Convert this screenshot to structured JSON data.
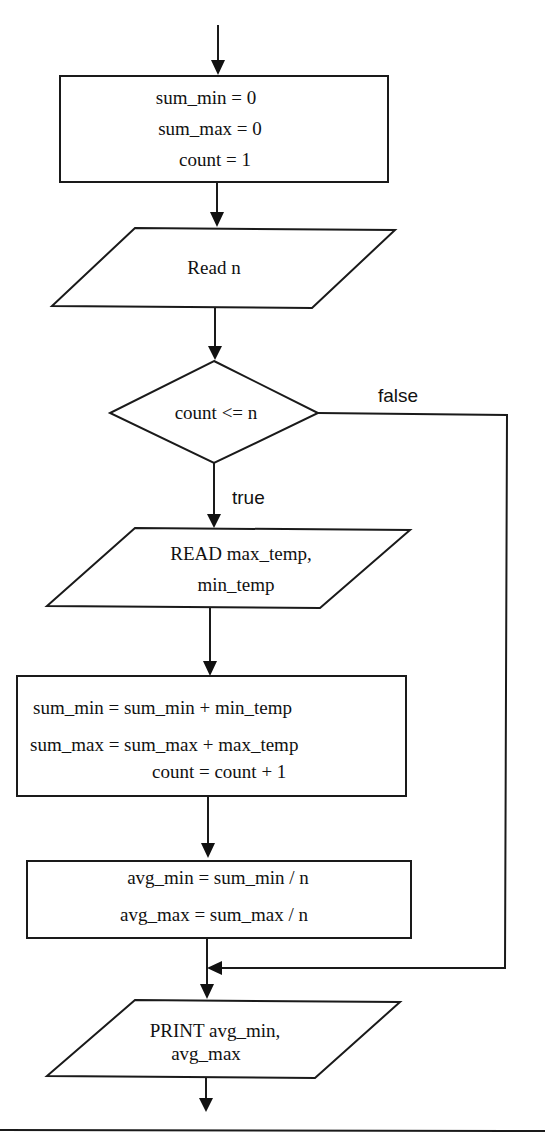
{
  "flowchart": {
    "init_box": {
      "lines": [
        "sum_min = 0",
        "sum_max = 0",
        "count = 1"
      ]
    },
    "read_n": {
      "text": "Read n"
    },
    "decision": {
      "condition": "count <= n",
      "true_label": "true",
      "false_label": "false"
    },
    "read_temps": {
      "lines": [
        "READ max_temp,",
        "min_temp"
      ]
    },
    "accumulate_box": {
      "lines": [
        "sum_min = sum_min + min_temp",
        "sum_max = sum_max + max_temp",
        "count = count + 1"
      ]
    },
    "average_box": {
      "lines": [
        "avg_min = sum_min / n",
        "avg_max = sum_max / n"
      ]
    },
    "print_box": {
      "lines": [
        "PRINT avg_min,",
        "avg_max"
      ]
    }
  },
  "colors": {
    "stroke": "#1a1a1a",
    "background": "#ffffff"
  }
}
